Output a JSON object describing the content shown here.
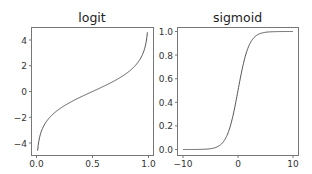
{
  "chart_data": [
    {
      "type": "line",
      "title": "logit",
      "xlabel": "",
      "ylabel": "",
      "xlim": [
        -0.03,
        1.03
      ],
      "ylim": [
        -5.0,
        5.0
      ],
      "xticks": [
        "0.0",
        "0.5",
        "1.0"
      ],
      "yticks": [
        "-4",
        "-2",
        "0",
        "2",
        "4"
      ],
      "grid": false,
      "series": [
        {
          "name": "logit",
          "x": [
            0.01,
            0.02,
            0.05,
            0.1,
            0.2,
            0.3,
            0.4,
            0.5,
            0.6,
            0.7,
            0.8,
            0.9,
            0.95,
            0.98,
            0.99
          ],
          "values": [
            -4.6,
            -3.89,
            -2.94,
            -2.2,
            -1.39,
            -0.85,
            -0.41,
            0.0,
            0.41,
            0.85,
            1.39,
            2.2,
            2.94,
            3.89,
            4.6
          ]
        }
      ]
    },
    {
      "type": "line",
      "title": "sigmoid",
      "xlabel": "",
      "ylabel": "",
      "xlim": [
        -11,
        11
      ],
      "ylim": [
        -0.05,
        1.05
      ],
      "xticks": [
        "-10",
        "0",
        "10"
      ],
      "yticks": [
        "0.0",
        "0.2",
        "0.4",
        "0.6",
        "0.8",
        "1.0"
      ],
      "grid": false,
      "series": [
        {
          "name": "sigmoid",
          "x": [
            -10,
            -8,
            -6,
            -4,
            -3,
            -2,
            -1,
            0,
            1,
            2,
            3,
            4,
            6,
            8,
            10
          ],
          "values": [
            0.0,
            0.0003,
            0.0025,
            0.018,
            0.047,
            0.119,
            0.269,
            0.5,
            0.731,
            0.881,
            0.953,
            0.982,
            0.9975,
            0.9997,
            1.0
          ]
        }
      ]
    }
  ],
  "charts": {
    "left": {
      "title": "logit",
      "xticks": [
        "0.0",
        "0.5",
        "1.0"
      ],
      "yticks": [
        "4",
        "2",
        "0",
        "−2",
        "−4"
      ]
    },
    "right": {
      "title": "sigmoid",
      "xticks": [
        "−10",
        "0",
        "10"
      ],
      "yticks": [
        "1.0",
        "0.8",
        "0.6",
        "0.4",
        "0.2",
        "0.0"
      ]
    },
    "line_color": "#555555",
    "frame_color": "#777777"
  }
}
